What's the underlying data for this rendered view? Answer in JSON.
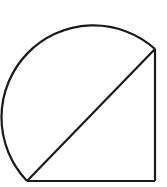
{
  "diagram": {
    "stroke_color": "#1a1a1a",
    "background": "#ffffff",
    "points": {
      "bottom_left": [
        27,
        181
      ],
      "bottom_right": [
        155,
        181
      ],
      "top_right": [
        155,
        49
      ]
    },
    "semicircle": {
      "center": [
        91,
        115
      ],
      "radius": 92
    }
  }
}
